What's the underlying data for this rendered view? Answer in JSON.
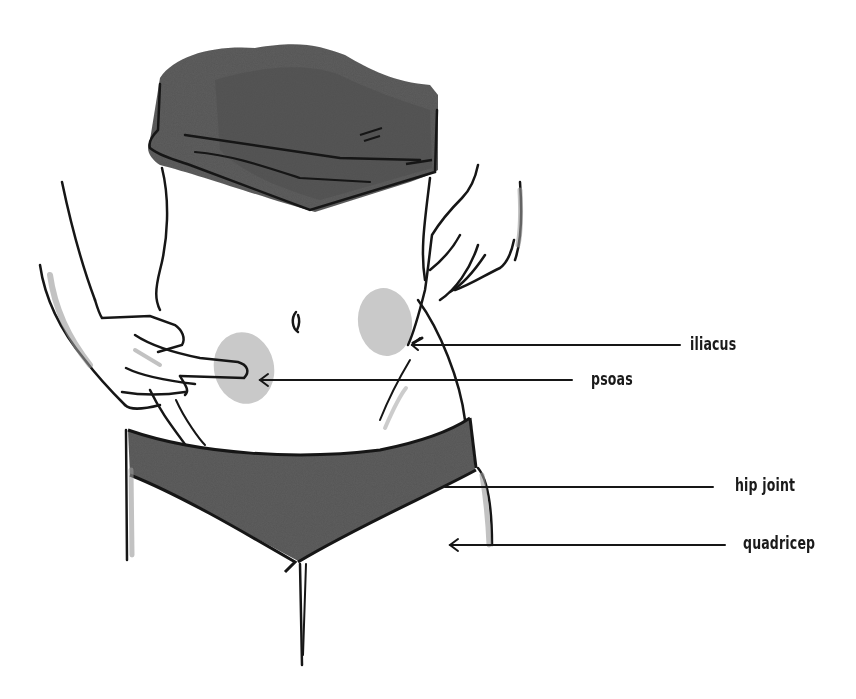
{
  "diagram": {
    "colors": {
      "ink": "#161616",
      "garment": "#5f5f5f",
      "garment_dark": "#4e4e4e",
      "muscle_spot": "#c9c9c9",
      "skin_shade": "#9a9a9a",
      "background": "#ffffff"
    },
    "labels": [
      {
        "id": "iliacus",
        "text": "iliacus"
      },
      {
        "id": "psoas",
        "text": "psoas"
      },
      {
        "id": "hip-joint",
        "text": "hip joint"
      },
      {
        "id": "quadricep",
        "text": "quadricep"
      }
    ]
  }
}
